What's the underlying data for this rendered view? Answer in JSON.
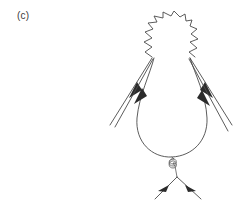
{
  "figure": {
    "panel_label": "(c)",
    "background_color": "#ffffff",
    "line_color": "#4a4a4a",
    "arrow_color": "#2b2b2b",
    "width": 250,
    "height": 204
  },
  "diagram": {
    "type": "feynman-diagram",
    "elements": [
      {
        "name": "photon-wavy-line",
        "style": "zigzag",
        "role": "photon propagator cap at top of loop",
        "from_vertex": "left-vertex",
        "to_vertex": "right-vertex"
      },
      {
        "name": "fermion-loop",
        "style": "solid-curve",
        "role": "closed teardrop fermion loop"
      },
      {
        "name": "gluon-spiral",
        "style": "coil",
        "role": "gluon propagator from loop bottom to lower vertex",
        "coils": 3
      },
      {
        "name": "external-line-upper-left",
        "style": "solid-arrow",
        "direction": "inward-up-right"
      },
      {
        "name": "external-line-lower-left",
        "style": "solid-arrow",
        "direction": "inward-up-right"
      },
      {
        "name": "external-line-upper-right",
        "style": "solid-arrow",
        "direction": "inward-up-left"
      },
      {
        "name": "external-line-lower-right",
        "style": "solid-arrow",
        "direction": "inward-up-left"
      },
      {
        "name": "external-line-bottom-left",
        "style": "solid-arrow",
        "direction": "inward-up-right"
      },
      {
        "name": "external-line-bottom-right",
        "style": "solid-arrow",
        "direction": "inward-up-left"
      }
    ],
    "vertices": [
      {
        "name": "left-vertex",
        "x": 152,
        "y": 57
      },
      {
        "name": "right-vertex",
        "x": 190,
        "y": 57
      },
      {
        "name": "loop-bottom-vertex",
        "x": 172,
        "y": 157
      },
      {
        "name": "gluon-bottom-vertex",
        "x": 177,
        "y": 177
      }
    ]
  }
}
